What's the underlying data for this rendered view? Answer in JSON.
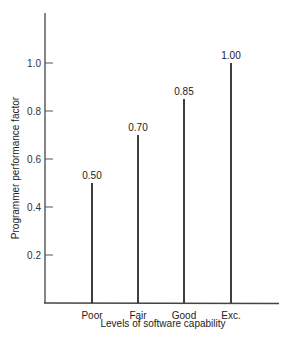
{
  "chart_data": {
    "type": "bar",
    "style": "stem",
    "title": "",
    "xlabel": "Levels of software capability",
    "ylabel": "Programmer performance factor",
    "categories": [
      "Poor",
      "Fair",
      "Good",
      "Exc."
    ],
    "values": [
      0.5,
      0.7,
      0.85,
      1.0
    ],
    "value_labels": [
      "0.50",
      "0.70",
      "0.85",
      "1.00"
    ],
    "yticks": [
      0.2,
      0.4,
      0.6,
      0.8,
      1.0
    ],
    "ytick_labels": [
      "0.2",
      "0.4",
      "0.6",
      "0.8",
      "1.0"
    ],
    "ylim": [
      0,
      1.2
    ],
    "grid": false,
    "legend": null,
    "colors": {
      "line": "#2a2a2a",
      "axis": "#444444"
    }
  }
}
